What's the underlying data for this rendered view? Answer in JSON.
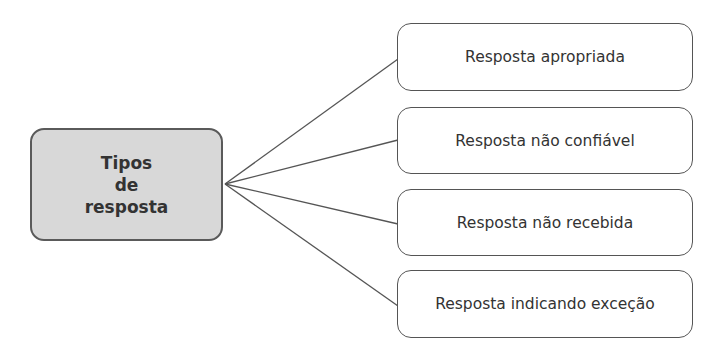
{
  "diagram": {
    "type": "tree",
    "colors": {
      "root_fill": "#d8d8d8",
      "border": "#555555",
      "line": "#555555",
      "text": "#333333"
    },
    "root": {
      "label": "Tipos\nde\nresposta"
    },
    "children": [
      {
        "label": "Resposta apropriada"
      },
      {
        "label": "Resposta não confiável"
      },
      {
        "label": "Resposta não recebida"
      },
      {
        "label": "Resposta indicando exceção"
      }
    ]
  }
}
